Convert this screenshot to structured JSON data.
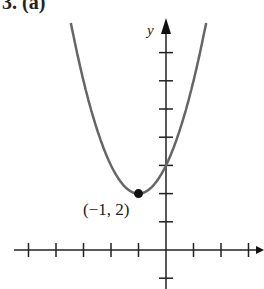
{
  "header": {
    "title": "3. (a)"
  },
  "chart_data": {
    "type": "line",
    "title": "3. (a)",
    "function": "y = (x + 1)^2 + 2",
    "xlabel": "",
    "ylabel": "y",
    "xlim": [
      -5,
      3
    ],
    "ylim": [
      -1,
      8
    ],
    "x_ticks": [
      -5,
      -4,
      -3,
      -2,
      -1,
      1,
      2,
      3
    ],
    "y_ticks": [
      -1,
      1,
      2,
      3,
      4,
      5,
      6,
      7
    ],
    "grid": false,
    "series": [
      {
        "name": "parabola",
        "x": [
          -3.46,
          -3,
          -2,
          -1,
          0,
          1,
          1.46
        ],
        "y": [
          8.05,
          6,
          3,
          2,
          3,
          6,
          8.05
        ]
      }
    ],
    "annotations": [
      {
        "text": "(−1, 2)",
        "x": -1,
        "y": 2,
        "marker": "filled-circle"
      }
    ]
  },
  "labels": {
    "y_axis": "y",
    "point": "(−1, 2)"
  }
}
